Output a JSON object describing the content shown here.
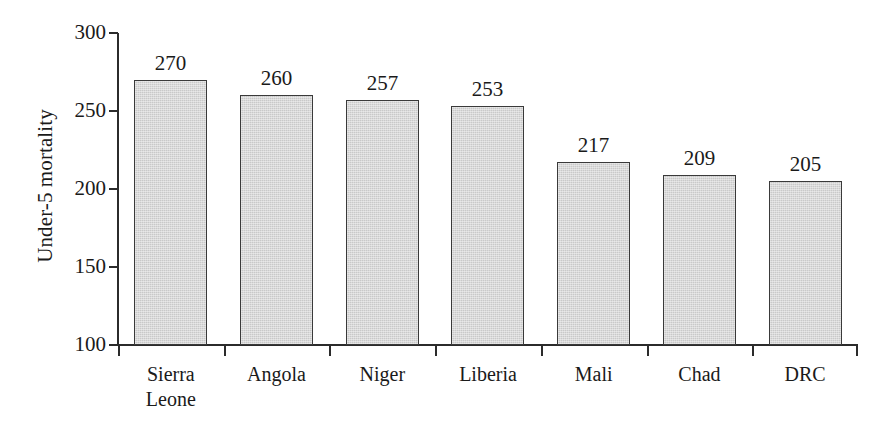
{
  "chart_data": {
    "type": "bar",
    "title": "",
    "subtitle": "",
    "xlabel": "",
    "ylabel": "Under-5 mortality",
    "categories": [
      "Sierra Leone",
      "Angola",
      "Niger",
      "Liberia",
      "Mali",
      "Chad",
      "DRC"
    ],
    "values": [
      270,
      260,
      257,
      253,
      217,
      209,
      205
    ],
    "value_labels": [
      "270",
      "260",
      "257",
      "253",
      "217",
      "209",
      "205"
    ],
    "ylim": [
      100,
      300
    ],
    "y_ticks": [
      300,
      250,
      200,
      150,
      100
    ],
    "y_tick_labels": [
      "300",
      "250",
      "200",
      "150",
      "100"
    ],
    "grid": false,
    "legend": null,
    "bar_color": "#c9c9c9",
    "bar_border_color": "#3a3a3a",
    "axis_color": "#2b2b2b",
    "background": "#ffffff"
  },
  "axes": {
    "y_title": "Under-5 mortality",
    "ticks": [
      {
        "label": "300",
        "value": 300
      },
      {
        "label": "250",
        "value": 250
      },
      {
        "label": "200",
        "value": 200
      },
      {
        "label": "150",
        "value": 150
      },
      {
        "label": "100",
        "value": 100
      }
    ]
  },
  "bars": [
    {
      "category": "Sierra Leone",
      "category_line1": "Sierra",
      "category_line2": "Leone",
      "value": 270,
      "value_label": "270"
    },
    {
      "category": "Angola",
      "category_line1": "Angola",
      "category_line2": "",
      "value": 260,
      "value_label": "260"
    },
    {
      "category": "Niger",
      "category_line1": "Niger",
      "category_line2": "",
      "value": 257,
      "value_label": "257"
    },
    {
      "category": "Liberia",
      "category_line1": "Liberia",
      "category_line2": "",
      "value": 253,
      "value_label": "253"
    },
    {
      "category": "Mali",
      "category_line1": "Mali",
      "category_line2": "",
      "value": 217,
      "value_label": "217"
    },
    {
      "category": "Chad",
      "category_line1": "Chad",
      "category_line2": "",
      "value": 209,
      "value_label": "209"
    },
    {
      "category": "DRC",
      "category_line1": "DRC",
      "category_line2": "",
      "value": 205,
      "value_label": "205"
    }
  ]
}
